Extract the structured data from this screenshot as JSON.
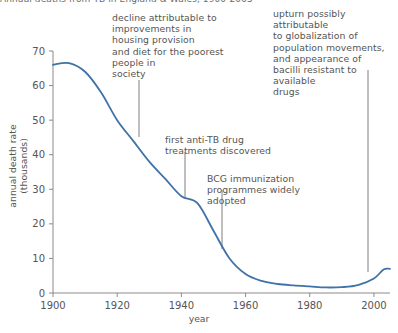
{
  "figure": {
    "title": "Annual deaths from TB in England & Wales, 1900-2005",
    "xlabel": "year",
    "ylabel": "annual death rate (thousands)",
    "line_color": "#3f72a8",
    "axis_color": "#8a8a8a",
    "text_color": "#555555"
  },
  "annotations": {
    "decline": "decline attributable to\nimprovements in\nhousing provision\nand diet for the poorest\npeople in\nsociety",
    "drugs": "first anti-TB drug\ntreatments discovered",
    "bcg": "BCG immunization\nprogrammes widely\nadopted",
    "upturn": "upturn possibly attributable\nto globalization of\npopulation movements,\nand appearance of\nbacilli resistant to available\ndrugs"
  },
  "chart_data": {
    "type": "line",
    "title": "Annual deaths from TB in England & Wales, 1900-2005",
    "xlabel": "year",
    "ylabel": "annual death rate (thousands)",
    "xlim": [
      1900,
      2005
    ],
    "ylim": [
      0,
      70
    ],
    "xticks": [
      1900,
      1920,
      1940,
      1960,
      1980,
      2000
    ],
    "yticks": [
      0,
      10,
      20,
      30,
      40,
      50,
      60,
      70
    ],
    "grid": false,
    "legend": "none",
    "series": [
      {
        "name": "annual death rate (thousands)",
        "x": [
          1900,
          1905,
          1910,
          1915,
          1920,
          1925,
          1930,
          1935,
          1940,
          1945,
          1950,
          1955,
          1960,
          1965,
          1970,
          1975,
          1980,
          1985,
          1990,
          1995,
          2000,
          2003,
          2005
        ],
        "values": [
          66,
          66.5,
          64,
          58,
          50,
          44,
          38,
          33,
          28,
          26,
          18,
          10,
          5.5,
          3.5,
          2.6,
          2.2,
          1.9,
          1.6,
          1.7,
          2.3,
          4.2,
          6.8,
          7.0
        ]
      }
    ],
    "annotation_markers": [
      {
        "label": "decline",
        "x": 1924,
        "y": 45
      },
      {
        "label": "drugs",
        "x": 1941,
        "y": 27.5
      },
      {
        "label": "bcg",
        "x": 1953,
        "y": 13
      },
      {
        "label": "upturn",
        "x": 2002,
        "y": 6.5
      }
    ]
  }
}
